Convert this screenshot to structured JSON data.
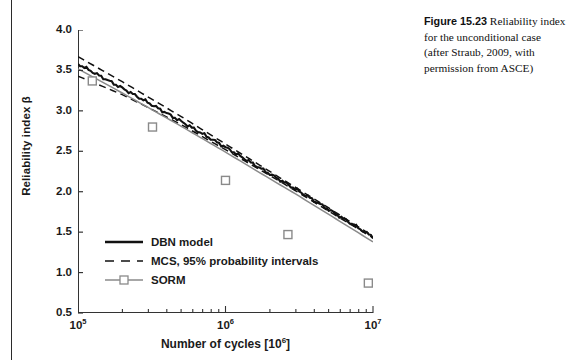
{
  "caption": {
    "label": "Figure 15.23",
    "text": "Reliability index for the unconditional case (after Straub, 2009, with permission from ASCE)"
  },
  "chart_data": {
    "type": "line",
    "title": "",
    "xlabel": "Number of cycles [10⁶]",
    "ylabel": "Reliability index β",
    "xscale": "log",
    "xlim": [
      100000,
      10000000
    ],
    "ylim": [
      0.5,
      4.0
    ],
    "grid": false,
    "legend_position": "lower-left",
    "xticks": [
      {
        "value": 100000,
        "label": "10",
        "exp": "5"
      },
      {
        "value": 1000000,
        "label": "10",
        "exp": "6"
      },
      {
        "value": 10000000,
        "label": "10",
        "exp": "7"
      }
    ],
    "yticks": [
      "4.0",
      "3.5",
      "3.0",
      "2.5",
      "2.0",
      "1.5",
      "1.0",
      "0.5"
    ],
    "ytick_values": [
      4.0,
      3.5,
      3.0,
      2.5,
      2.0,
      1.5,
      1.0,
      0.5
    ],
    "series": [
      {
        "name": "DBN model",
        "style": "solid",
        "color": "#111111",
        "x": [
          100000,
          200000,
          300000,
          500000,
          1000000,
          2000000,
          3000000,
          5000000,
          10000000
        ],
        "values": [
          3.58,
          3.28,
          3.1,
          2.87,
          2.55,
          2.22,
          2.03,
          1.78,
          1.44
        ]
      },
      {
        "name": "MCS, 95% probability intervals",
        "style": "dashed",
        "color": "#111111",
        "bounds": [
          {
            "name": "upper",
            "x": [
              100000,
              200000,
              300000,
              500000,
              1000000,
              2000000,
              3000000,
              5000000,
              10000000
            ],
            "values": [
              3.67,
              3.36,
              3.17,
              2.93,
              2.59,
              2.25,
              2.05,
              1.8,
              1.45
            ]
          },
          {
            "name": "lower",
            "x": [
              100000,
              200000,
              300000,
              500000,
              1000000,
              2000000,
              3000000,
              5000000,
              10000000
            ],
            "values": [
              3.43,
              3.2,
              3.04,
              2.83,
              2.52,
              2.2,
              2.01,
              1.76,
              1.43
            ]
          }
        ]
      },
      {
        "name": "SORM",
        "style": "solid-markers",
        "color": "#8a8a8a",
        "marker": "open-square",
        "x": [
          100000,
          200000,
          300000,
          500000,
          1000000,
          2000000,
          3000000,
          5000000,
          10000000
        ],
        "values": [
          3.52,
          3.22,
          3.04,
          2.81,
          2.49,
          2.16,
          1.97,
          1.72,
          1.38
        ],
        "marker_points": [
          {
            "x": 125000,
            "y": 3.37
          },
          {
            "x": 320000,
            "y": 2.8
          },
          {
            "x": 1000000,
            "y": 2.14
          },
          {
            "x": 2650000,
            "y": 1.47
          },
          {
            "x": 9300000,
            "y": 0.87
          }
        ]
      }
    ]
  },
  "legend": [
    {
      "label": "DBN model",
      "style": "solid",
      "color": "#111111"
    },
    {
      "label": "MCS, 95% probability intervals",
      "style": "dashed",
      "color": "#111111"
    },
    {
      "label": "SORM",
      "style": "solid-markers",
      "color": "#8a8a8a"
    }
  ]
}
